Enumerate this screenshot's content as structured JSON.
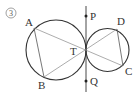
{
  "figure": {
    "number_label": "3",
    "colors": {
      "stroke": "#333333",
      "chord": "#777777",
      "background": "#ffffff"
    },
    "circles": [
      {
        "name": "left-circle",
        "cx": 56,
        "cy": 50,
        "r": 30
      },
      {
        "name": "right-circle",
        "cx": 107.5,
        "cy": 50,
        "r": 21.5
      }
    ],
    "tangent_line": {
      "x": 86,
      "y1": 6,
      "y2": 92
    },
    "points": {
      "A": {
        "label": "A",
        "x": 34,
        "y": 28,
        "lx": 25,
        "ly": 26
      },
      "B": {
        "label": "B",
        "x": 44,
        "y": 77,
        "lx": 38,
        "ly": 89
      },
      "C": {
        "label": "C",
        "x": 123,
        "y": 66,
        "lx": 125,
        "ly": 75
      },
      "D": {
        "label": "D",
        "x": 117,
        "y": 29,
        "lx": 117,
        "ly": 25
      },
      "T": {
        "label": "T",
        "x": 86,
        "y": 50,
        "lx": 70,
        "ly": 55
      },
      "P": {
        "label": "P",
        "x": 86,
        "y": 16,
        "lx": 90,
        "ly": 20
      },
      "Q": {
        "label": "Q",
        "x": 86,
        "y": 81,
        "lx": 90,
        "ly": 85
      }
    },
    "segments": [
      [
        "A",
        "B"
      ],
      [
        "A",
        "C"
      ],
      [
        "B",
        "D"
      ],
      [
        "D",
        "C"
      ]
    ]
  }
}
